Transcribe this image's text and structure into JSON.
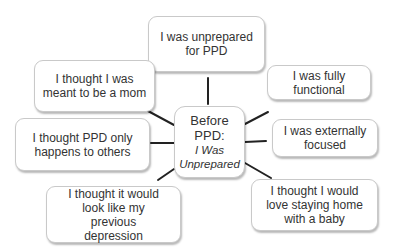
{
  "diagram": {
    "type": "radial-mind-map",
    "center": {
      "title": "Before PPD:",
      "subtitle": "I Was Unprepared"
    },
    "nodes": [
      {
        "id": "top",
        "label": "I was unprepared for PPD"
      },
      {
        "id": "upper-left",
        "label": "I thought I was meant to be a mom"
      },
      {
        "id": "upper-right",
        "label": "I was fully functional"
      },
      {
        "id": "left",
        "label": "I thought PPD only happens to others"
      },
      {
        "id": "right",
        "label": "I was externally focused"
      },
      {
        "id": "lower-left",
        "label": "I thought it would look like my previous depression"
      },
      {
        "id": "lower-right",
        "label": "I thought I would love staying home with a baby"
      }
    ],
    "colors": {
      "text": "#333333",
      "line": "#222222",
      "border": "#c9c9c9",
      "background": "#ffffff"
    }
  }
}
